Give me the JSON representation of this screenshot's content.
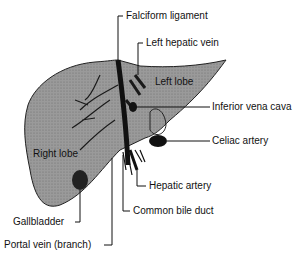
{
  "diagram": {
    "colors": {
      "liver_fill": "#8f8f8f",
      "vessel_dark": "#1a1a1a",
      "line": "#111111",
      "background": "#ffffff"
    },
    "region_labels": {
      "right_lobe": "Right lobe",
      "left_lobe": "Left lobe"
    },
    "callouts": [
      {
        "id": "falciform",
        "text": "Falciform ligament"
      },
      {
        "id": "left_hepatic_vein",
        "text": "Left hepatic vein"
      },
      {
        "id": "inferior_vena_cava",
        "text": "Inferior vena cava"
      },
      {
        "id": "celiac_artery",
        "text": "Celiac artery"
      },
      {
        "id": "hepatic_artery",
        "text": "Hepatic artery"
      },
      {
        "id": "common_bile_duct",
        "text": "Common bile duct"
      },
      {
        "id": "gallbladder",
        "text": "Gallbladder"
      },
      {
        "id": "portal_vein",
        "text": "Portal vein (branch)"
      }
    ]
  }
}
